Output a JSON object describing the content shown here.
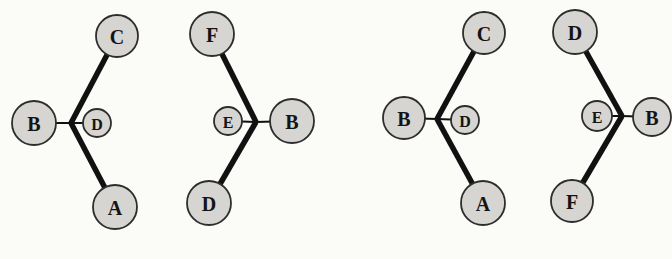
{
  "colors": {
    "background": "#fbfbf8",
    "node_fill": "#d6d5d2",
    "node_stroke": "#2d2d2d",
    "bond": "#111111"
  },
  "diagram": {
    "type": "molecular-configurations",
    "thick_bond_width": 5.5,
    "thin_bond_width": 2,
    "groups": [
      {
        "name": "left-structure-1",
        "vertex": {
          "x": 71,
          "y": 123
        },
        "nodes": [
          {
            "label": "C",
            "x": 117,
            "y": 36,
            "r": 21,
            "small": false,
            "bond": "thick"
          },
          {
            "label": "A",
            "x": 115,
            "y": 207,
            "r": 22,
            "small": false,
            "bond": "thick"
          },
          {
            "label": "B",
            "x": 34,
            "y": 123,
            "r": 22,
            "small": false,
            "bond": "thin"
          },
          {
            "label": "D",
            "x": 97,
            "y": 123,
            "r": 14,
            "small": true,
            "bond": "thin"
          }
        ]
      },
      {
        "name": "left-structure-2",
        "vertex": {
          "x": 256,
          "y": 122
        },
        "nodes": [
          {
            "label": "F",
            "x": 212,
            "y": 34,
            "r": 22,
            "small": false,
            "bond": "thick"
          },
          {
            "label": "D",
            "x": 209,
            "y": 203,
            "r": 22,
            "small": false,
            "bond": "thick"
          },
          {
            "label": "B",
            "x": 292,
            "y": 121,
            "r": 22,
            "small": false,
            "bond": "thin"
          },
          {
            "label": "E",
            "x": 228,
            "y": 121,
            "r": 14,
            "small": true,
            "bond": "thin"
          }
        ]
      },
      {
        "name": "right-structure-1",
        "vertex": {
          "x": 437,
          "y": 119
        },
        "nodes": [
          {
            "label": "C",
            "x": 484,
            "y": 33,
            "r": 21,
            "small": false,
            "bond": "thick"
          },
          {
            "label": "A",
            "x": 483,
            "y": 203,
            "r": 22,
            "small": false,
            "bond": "thick"
          },
          {
            "label": "B",
            "x": 404,
            "y": 118,
            "r": 21,
            "small": false,
            "bond": "thin"
          },
          {
            "label": "D",
            "x": 465,
            "y": 120,
            "r": 14,
            "small": true,
            "bond": "thin"
          }
        ]
      },
      {
        "name": "right-structure-2",
        "vertex": {
          "x": 622,
          "y": 116
        },
        "nodes": [
          {
            "label": "D",
            "x": 575,
            "y": 32,
            "r": 22,
            "small": false,
            "bond": "thick"
          },
          {
            "label": "F",
            "x": 572,
            "y": 201,
            "r": 21,
            "small": false,
            "bond": "thick"
          },
          {
            "label": "B",
            "x": 652,
            "y": 117,
            "r": 19,
            "small": false,
            "bond": "thin"
          },
          {
            "label": "E",
            "x": 597,
            "y": 116,
            "r": 15,
            "small": true,
            "bond": "thin"
          }
        ]
      }
    ]
  }
}
